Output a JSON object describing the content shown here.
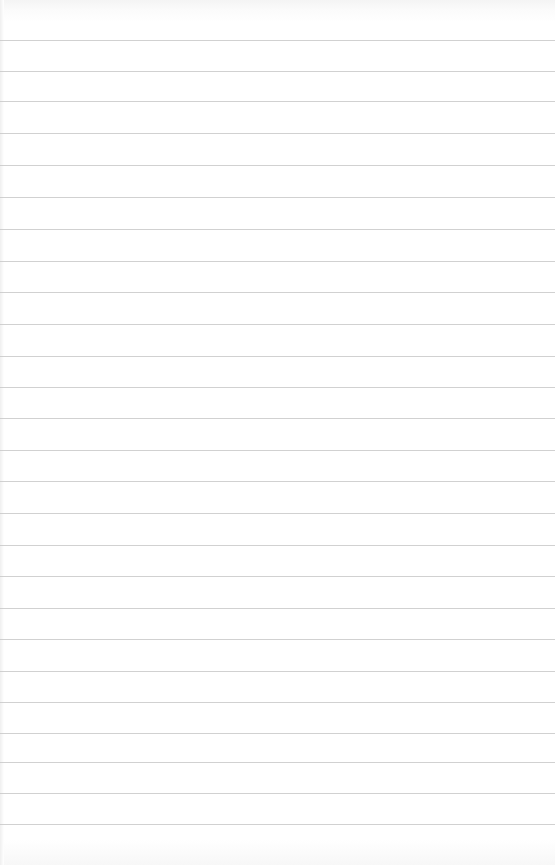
{
  "paper": {
    "type": "lined-paper",
    "background_color": "#ffffff",
    "rule_color": "#c9c9c9",
    "rule_positions_y": [
      40,
      71,
      101,
      133,
      165,
      197,
      229,
      261,
      292,
      324,
      356,
      387,
      418,
      450,
      481,
      513,
      545,
      576,
      608,
      639,
      671,
      702,
      733,
      762,
      793,
      824
    ]
  }
}
